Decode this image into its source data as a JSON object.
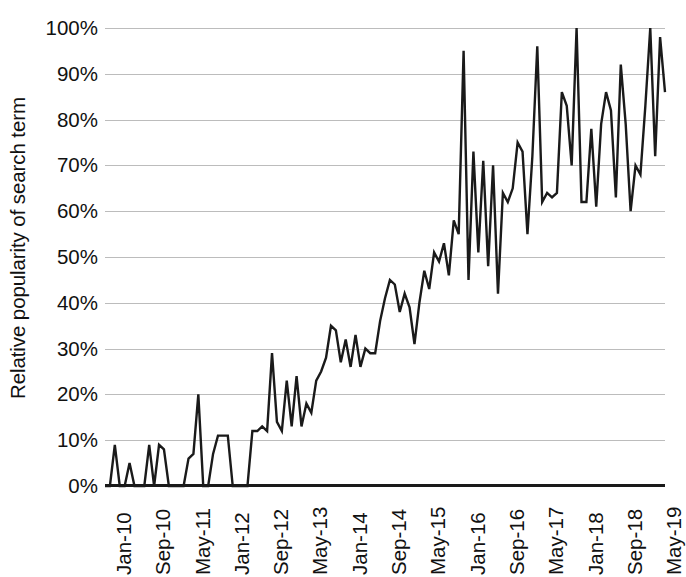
{
  "chart_data": {
    "type": "line",
    "title": "",
    "xlabel": "",
    "ylabel": "Relative popularity of search term",
    "ylim": [
      0,
      100
    ],
    "y_unit": "%",
    "grid": true,
    "legend": "none",
    "y_ticks": [
      "0%",
      "10%",
      "20%",
      "30%",
      "40%",
      "50%",
      "60%",
      "70%",
      "80%",
      "90%",
      "100%"
    ],
    "y_tick_values": [
      0,
      10,
      20,
      30,
      40,
      50,
      60,
      70,
      80,
      90,
      100
    ],
    "x_ticks": [
      "Jan-10",
      "Sep-10",
      "May-11",
      "Jan-12",
      "Sep-12",
      "May-13",
      "Jan-14",
      "Sep-14",
      "May-15",
      "Jan-16",
      "Sep-16",
      "May-17",
      "Jan-18",
      "Sep-18",
      "May-19"
    ],
    "x_tick_indices": [
      0,
      8,
      16,
      24,
      32,
      40,
      48,
      56,
      64,
      72,
      80,
      88,
      96,
      104,
      112
    ],
    "x_start": "Jan-10",
    "x_end": "Aug-19",
    "x_interval": "monthly",
    "series": [
      {
        "name": "Relative popularity",
        "color": "#1a1a1a",
        "values": [
          0,
          0,
          9,
          0,
          0,
          5,
          0,
          0,
          0,
          9,
          0,
          9,
          8,
          0,
          0,
          0,
          0,
          6,
          7,
          20,
          0,
          0,
          7,
          11,
          11,
          11,
          0,
          0,
          0,
          0,
          12,
          12,
          13,
          12,
          29,
          14,
          12,
          23,
          13,
          24,
          13,
          18,
          16,
          23,
          25,
          28,
          35,
          34,
          27,
          32,
          26,
          33,
          26,
          30,
          29,
          29,
          36,
          41,
          45,
          44,
          38,
          42,
          39,
          31,
          40,
          47,
          43,
          51,
          49,
          53,
          46,
          58,
          55,
          95,
          45,
          73,
          51,
          71,
          48,
          70,
          42,
          64,
          62,
          65,
          75,
          73,
          55,
          72,
          96,
          62,
          64,
          63,
          64,
          86,
          83,
          70,
          100,
          62,
          62,
          78,
          61,
          79,
          86,
          82,
          63,
          92,
          79,
          60,
          70,
          68,
          83,
          100,
          72,
          98,
          86
        ]
      }
    ]
  },
  "axis": {
    "y_title": "Relative popularity of search term"
  },
  "style": {
    "line_color": "#1a1a1a",
    "gridline_color": "#bcbcbc",
    "axis_color": "#1a1a1a",
    "background": "#ffffff",
    "text_color": "#111111"
  }
}
